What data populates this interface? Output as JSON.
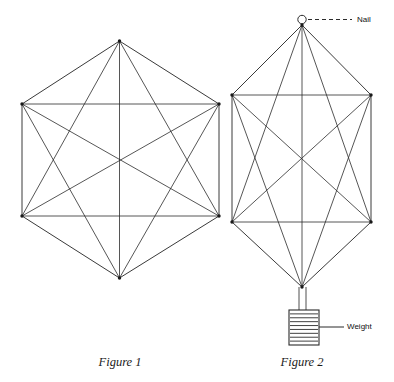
{
  "page": {
    "background_color": "#ffffff",
    "line_color": "#2b2b2b",
    "width": 394,
    "height": 382
  },
  "figures": [
    {
      "id": "figure-1",
      "caption": "Figure 1",
      "caption_x": 120,
      "caption_y": 355,
      "description": "Regular hexagon with all diagonals drawn (complete graph on 6 vertices)",
      "vertices": [
        {
          "name": "top",
          "x": 119.5,
          "y": 41.0
        },
        {
          "name": "upper-right",
          "x": 219.0,
          "y": 104.0
        },
        {
          "name": "lower-right",
          "x": 219.0,
          "y": 216.0
        },
        {
          "name": "bottom",
          "x": 119.5,
          "y": 278.0
        },
        {
          "name": "lower-left",
          "x": 22.0,
          "y": 216.0
        },
        {
          "name": "upper-left",
          "x": 22.0,
          "y": 104.0
        }
      ],
      "edges": [
        [
          0,
          1
        ],
        [
          1,
          2
        ],
        [
          2,
          3
        ],
        [
          3,
          4
        ],
        [
          4,
          5
        ],
        [
          5,
          0
        ],
        [
          0,
          2
        ],
        [
          0,
          3
        ],
        [
          0,
          4
        ],
        [
          1,
          3
        ],
        [
          1,
          4
        ],
        [
          1,
          5
        ],
        [
          2,
          4
        ],
        [
          2,
          5
        ],
        [
          3,
          5
        ]
      ]
    },
    {
      "id": "figure-2",
      "caption": "Figure 2",
      "caption_x": 302,
      "caption_y": 355,
      "description": "Same hexagonal linkage stretched vertically, hung from a nail with a weight suspended below",
      "vertices": [
        {
          "name": "top",
          "x": 302.0,
          "y": 25.0
        },
        {
          "name": "upper-right",
          "x": 371.0,
          "y": 95.0
        },
        {
          "name": "lower-right",
          "x": 371.0,
          "y": 222.0
        },
        {
          "name": "bottom",
          "x": 302.0,
          "y": 287.0
        },
        {
          "name": "lower-left",
          "x": 232.0,
          "y": 222.0
        },
        {
          "name": "upper-left",
          "x": 232.0,
          "y": 95.0
        }
      ],
      "edges": [
        [
          0,
          1
        ],
        [
          1,
          2
        ],
        [
          2,
          3
        ],
        [
          3,
          4
        ],
        [
          4,
          5
        ],
        [
          5,
          0
        ],
        [
          0,
          2
        ],
        [
          0,
          3
        ],
        [
          0,
          4
        ],
        [
          1,
          3
        ],
        [
          1,
          4
        ],
        [
          1,
          5
        ],
        [
          2,
          4
        ],
        [
          2,
          5
        ],
        [
          3,
          5
        ]
      ]
    }
  ],
  "annotations": {
    "nail": {
      "label": "Nail",
      "label_x": 357,
      "label_y": 16,
      "circle_x": 302,
      "circle_y": 19.5,
      "circle_r": 4.2,
      "leader_x1": 308,
      "leader_x2": 352,
      "leader_y": 19.5,
      "leader_style": "dashed"
    },
    "weight": {
      "label": "Weight",
      "label_x": 347,
      "label_y": 323,
      "leader_x1": 319,
      "leader_x2": 344,
      "leader_y": 327,
      "leader_style": "solid",
      "box_x": 289,
      "box_y": 310,
      "box_w": 30,
      "box_h": 35,
      "stripe_count": 8,
      "stem_x1": 299,
      "stem_x2": 306,
      "stem_top": 287,
      "stem_bottom": 310
    }
  }
}
